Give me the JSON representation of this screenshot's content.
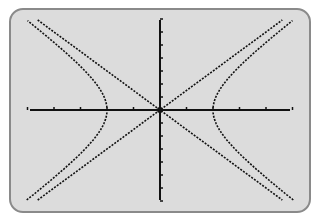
{
  "screen": {
    "background": "#dcdcdc",
    "border": "#8a8a8a",
    "ink": "#111111"
  },
  "chart_data": {
    "type": "line",
    "title": "",
    "xlabel": "",
    "ylabel": "",
    "xlim": [
      -5,
      5
    ],
    "ylim": [
      -7,
      7
    ],
    "x_ticks": [
      -5,
      -4,
      -3,
      -2,
      -1,
      1,
      2,
      3,
      4,
      5
    ],
    "y_ticks": [
      -7,
      -6,
      -5,
      -4,
      -3,
      -2,
      -1,
      1,
      2,
      3,
      4,
      5,
      6,
      7
    ],
    "grid": false,
    "legend": null,
    "series": [
      {
        "name": "hyperbola",
        "equation": "x^2/4 - y^2/9 = 1",
        "a": 2,
        "b": 3,
        "style": "dotted"
      },
      {
        "name": "asymptote-1",
        "equation": "y = 1.5x",
        "style": "dotted"
      },
      {
        "name": "asymptote-2",
        "equation": "y = -1.5x",
        "style": "dotted"
      }
    ]
  }
}
